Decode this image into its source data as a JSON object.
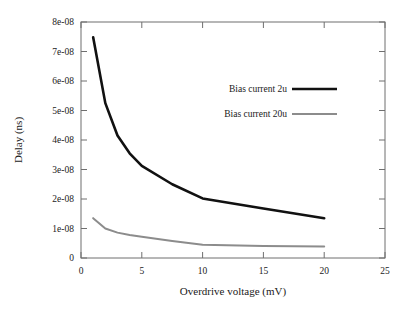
{
  "chart_data": {
    "type": "line",
    "title": "",
    "xlabel": "Overdrive voltage (mV)",
    "ylabel": "Delay (ns)",
    "xlim": [
      0,
      25
    ],
    "ylim": [
      0,
      8e-08
    ],
    "grid": false,
    "legend_position": "inside-upper-right",
    "xticks": [
      0,
      5,
      10,
      15,
      20,
      25
    ],
    "xtick_labels": [
      "0",
      "5",
      "10",
      "15",
      "20",
      "25"
    ],
    "yticks": [
      0,
      1e-08,
      2e-08,
      3e-08,
      4e-08,
      5e-08,
      6e-08,
      7e-08,
      8e-08
    ],
    "ytick_labels": [
      "0",
      "1e-08",
      "2e-08",
      "3e-08",
      "4e-08",
      "5e-08",
      "6e-08",
      "7e-08",
      "8e-08"
    ],
    "x": [
      1,
      2,
      3,
      4,
      5,
      7.5,
      10,
      15,
      20
    ],
    "series": [
      {
        "name": "Bias current 2u",
        "color": "#111111",
        "width": 2.6,
        "values": [
          7.48e-08,
          5.25e-08,
          4.15e-08,
          3.55e-08,
          3.12e-08,
          2.5e-08,
          2.02e-08,
          1.68e-08,
          1.35e-08
        ]
      },
      {
        "name": "Bias current 20u",
        "color": "#8c8c8c",
        "width": 2.0,
        "values": [
          1.35e-08,
          1e-08,
          8.6e-09,
          7.8e-09,
          7.2e-09,
          5.8e-09,
          4.5e-09,
          4.1e-09,
          3.9e-09
        ]
      }
    ]
  },
  "legend": {
    "entries": [
      {
        "label": "Bias current 2u"
      },
      {
        "label": "Bias current 20u"
      }
    ]
  },
  "axes": {
    "x_title": "Overdrive voltage (mV)",
    "y_title": "Delay (ns)",
    "x_labels": [
      "0",
      "5",
      "10",
      "15",
      "20",
      "25"
    ],
    "y_labels": [
      "0",
      "1e-08",
      "2e-08",
      "3e-08",
      "4e-08",
      "5e-08",
      "6e-08",
      "7e-08",
      "8e-08"
    ]
  }
}
